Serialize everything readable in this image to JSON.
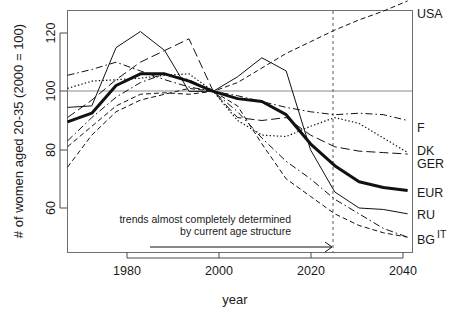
{
  "chart_data": {
    "type": "line",
    "title": "",
    "xlabel": "year",
    "ylabel": "# of women aged 20-35 (2000 = 100)",
    "xlim": [
      1970,
      2041
    ],
    "ylim": [
      46,
      132
    ],
    "xticks": [
      1980,
      2000,
      2020,
      2040
    ],
    "xtick_labels": [
      "1980",
      "2000",
      "2020",
      "2040"
    ],
    "yticks": [
      60,
      80,
      100,
      120
    ],
    "ytick_labels": [
      "60",
      "80",
      "100",
      "120"
    ],
    "grid": false,
    "reference_line_y": 100,
    "vertical_marker_x": 2025,
    "legend_position": "right-inline",
    "annotations": [
      {
        "id": "trend-note",
        "line1": "trends almost completely determined",
        "line2": "by current age structure",
        "arrow_from_x": 1990,
        "arrow_to_x": 2025,
        "arrow_y": 50
      }
    ],
    "series": [
      {
        "name": "USA",
        "label": "USA",
        "style": "dashed",
        "width": 1,
        "x": [
          1970,
          1975,
          1980,
          1985,
          1990,
          1995,
          2000,
          2005,
          2010,
          2015,
          2020,
          2025,
          2030,
          2035,
          2040
        ],
        "values": [
          81,
          88,
          95,
          99,
          99.5,
          99,
          100,
          103,
          108,
          113,
          117,
          121,
          124.5,
          127.5,
          131
        ]
      },
      {
        "name": "F",
        "label": "F",
        "style": "dashdot",
        "width": 1,
        "x": [
          1970,
          1975,
          1980,
          1985,
          1990,
          1995,
          2000,
          2005,
          2010,
          2015,
          2020,
          2025,
          2030,
          2035,
          2040
        ],
        "values": [
          105.5,
          107.5,
          110,
          107,
          104,
          101.5,
          100,
          98.5,
          96.5,
          94.5,
          93,
          92,
          92.5,
          92,
          90
        ]
      },
      {
        "name": "DK",
        "label": "DK",
        "style": "dotted",
        "width": 1.2,
        "x": [
          1970,
          1975,
          1980,
          1985,
          1990,
          1995,
          2000,
          2005,
          2010,
          2015,
          2020,
          2025,
          2030,
          2035,
          2040
        ],
        "values": [
          101,
          103.5,
          104,
          104.5,
          105.5,
          106,
          100,
          90,
          85,
          84.5,
          88,
          91,
          89,
          84,
          79
        ]
      },
      {
        "name": "GER",
        "label": "GER",
        "style": "longdash",
        "width": 1,
        "x": [
          1970,
          1975,
          1980,
          1985,
          1990,
          1995,
          2000,
          2005,
          2010,
          2015,
          2020,
          2025,
          2030,
          2035,
          2040
        ],
        "values": [
          91,
          97,
          104,
          110,
          114,
          118,
          100,
          91,
          90,
          91,
          85,
          81,
          79.5,
          79,
          78.5
        ]
      },
      {
        "name": "EUR",
        "label": "EUR",
        "style": "solid",
        "width": 3,
        "x": [
          1970,
          1975,
          1980,
          1985,
          1990,
          1995,
          2000,
          2005,
          2010,
          2015,
          2020,
          2025,
          2030,
          2035,
          2040
        ],
        "values": [
          89.5,
          92.5,
          102,
          106,
          106,
          103.5,
          100,
          97.5,
          96.5,
          92,
          82,
          74.5,
          69,
          67,
          66
        ]
      },
      {
        "name": "RU",
        "label": "RU",
        "style": "solid",
        "width": 1,
        "x": [
          1970,
          1975,
          1980,
          1985,
          1990,
          1995,
          2000,
          2005,
          2010,
          2015,
          2020,
          2025,
          2030,
          2035,
          2040
        ],
        "values": [
          94.5,
          95,
          115,
          120.5,
          114,
          100,
          100,
          105,
          111.5,
          107,
          80,
          65.5,
          60,
          59.5,
          58
        ]
      },
      {
        "name": "BG",
        "label": "BG",
        "style": "dashed",
        "width": 1,
        "x": [
          1970,
          1975,
          1980,
          1985,
          1990,
          1995,
          2000,
          2005,
          2010,
          2015,
          2020,
          2025,
          2030,
          2035,
          2040
        ],
        "values": [
          74,
          85,
          93,
          97,
          99,
          101,
          100,
          95,
          82,
          70,
          64,
          58,
          54,
          51.5,
          50
        ]
      },
      {
        "name": "IT",
        "label": "IT",
        "style": "dashdot",
        "width": 1,
        "x": [
          1970,
          1975,
          1980,
          1985,
          1990,
          1995,
          2000,
          2005,
          2010,
          2015,
          2020,
          2025,
          2030,
          2035,
          2040
        ],
        "values": [
          83,
          91,
          98,
          103,
          106,
          104,
          100,
          93,
          84,
          76,
          70,
          63,
          58,
          53,
          50
        ]
      }
    ]
  },
  "axis": {
    "y_title": "# of women aged 20-35 (2000 = 100)",
    "x_title": "year"
  },
  "labels": {
    "usa": "USA",
    "f": "F",
    "dk": "DK",
    "ger": "GER",
    "eur": "EUR",
    "ru": "RU",
    "bg": "BG",
    "it": "IT"
  },
  "ticks": {
    "x": [
      "1980",
      "2000",
      "2020",
      "2040"
    ],
    "y": [
      "60",
      "80",
      "100",
      "120"
    ]
  },
  "annotation": {
    "line1": "trends almost completely determined",
    "line2": "by current age structure"
  },
  "colors": {
    "ink": "#111111",
    "axis": "#4a4a4a",
    "reference": "#8a8a8a",
    "border": "#6e6e6e",
    "background": "#ffffff"
  }
}
